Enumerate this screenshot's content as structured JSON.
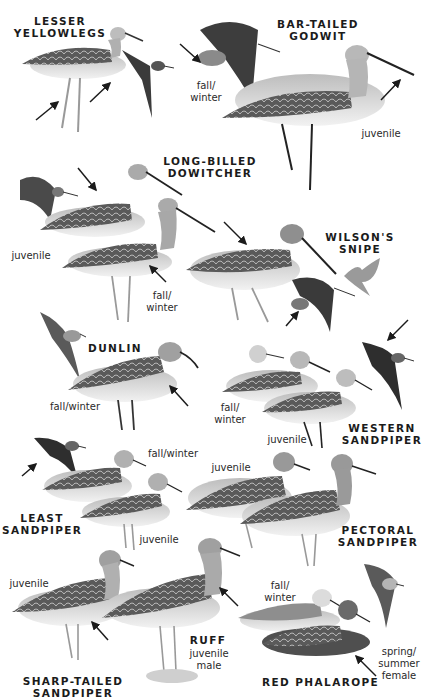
{
  "plate": {
    "background": "#ffffff",
    "ink_color": "#1b1b1b",
    "species": [
      {
        "id": "lesser-yellowlegs",
        "name": "LESSER\nYELLOWLEGS",
        "labels": []
      },
      {
        "id": "bar-tailed-godwit",
        "name": "BAR-TAILED\nGODWIT",
        "labels": [
          "fall/\nwinter",
          "juvenile"
        ]
      },
      {
        "id": "long-billed-dowitcher",
        "name": "LONG-BILLED\nDOWITCHER",
        "labels": [
          "juvenile",
          "fall/\nwinter"
        ]
      },
      {
        "id": "wilsons-snipe",
        "name": "WILSON'S\nSNIPE",
        "labels": []
      },
      {
        "id": "dunlin",
        "name": "DUNLIN",
        "labels": [
          "fall/winter"
        ]
      },
      {
        "id": "western-sandpiper",
        "name": "WESTERN\nSANDPIPER",
        "labels": [
          "fall/\nwinter",
          "juvenile"
        ]
      },
      {
        "id": "least-sandpiper",
        "name": "LEAST\nSANDPIPER",
        "labels": [
          "fall/winter",
          "juvenile"
        ]
      },
      {
        "id": "pectoral-sandpiper",
        "name": "PECTORAL\nSANDPIPER",
        "labels": [
          "juvenile"
        ]
      },
      {
        "id": "sharp-tailed-sandpiper",
        "name": "SHARP-TAILED\nSANDPIPER",
        "labels": [
          "juvenile"
        ]
      },
      {
        "id": "ruff",
        "name": "RUFF",
        "labels": [
          "juvenile\nmale"
        ]
      },
      {
        "id": "red-phalarope",
        "name": "RED PHALAROPE",
        "labels": [
          "fall/\nwinter",
          "spring/\nsummer\nfemale"
        ]
      }
    ]
  }
}
